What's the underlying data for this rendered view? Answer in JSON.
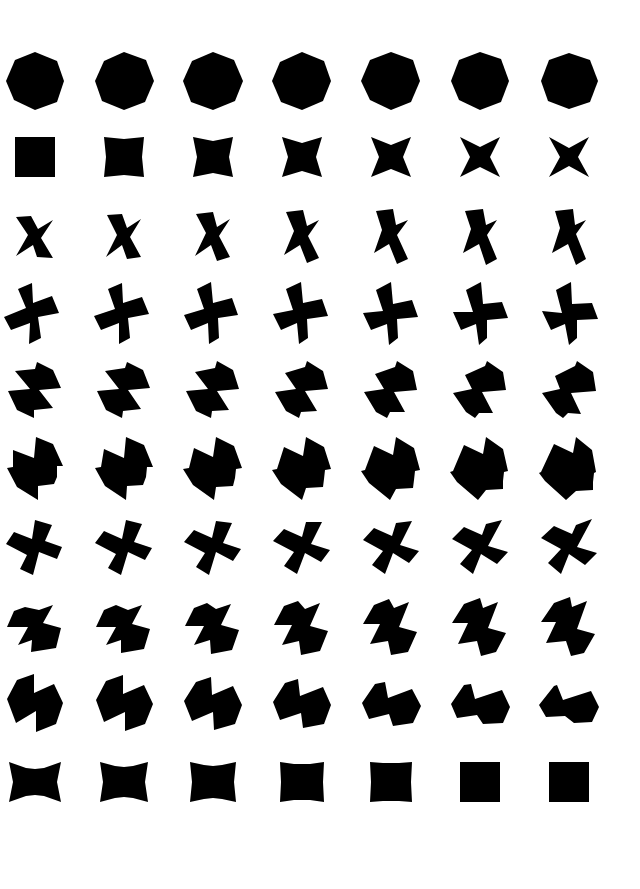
{
  "page": {
    "width": 640,
    "height": 889,
    "background": "#ffffff",
    "fill": "#000000"
  },
  "grid": {
    "columns": 7,
    "rows": 10,
    "col_centers": [
      35,
      124,
      213,
      302,
      391,
      480,
      569
    ],
    "row_centers": [
      81,
      157,
      237,
      313,
      390,
      468,
      547,
      627,
      703,
      782
    ]
  },
  "rows": [
    {
      "name": "octagon-row",
      "shapes": [
        "0,-29 22,-20 29,0 22,21 0,29 -21,19 -29,0 -20,-21",
        "0,-29 22,-21 30,0 21,21 0,29 -22,20 -29,0 -20,-20",
        "0,-29 21,-21 30,0 22,20 0,29 -22,21 -30,0 -21,-20",
        "0,-29 22,-20 29,0 21,20 0,29 -21,21 -30,0 -22,-19",
        "0,-29 22,-21 29,0 20,21 0,29 -21,19 -30,0 -21,-21",
        "0,-29 21,-22 29,0 21,21 0,29 -21,19 -29,0 -21,-21",
        "0,-28 21,-21 29,0 21,21 0,28 -21,20 -28,0 -20,-21"
      ]
    },
    {
      "name": "square-to-star-row",
      "shapes": [
        "-20,-20 0,-20 20,-20 20,0 20,20 0,20 -20,20 -20,0",
        "-20,-20 0,-18 20,-20 18,0 20,20 0,18 -20,20 -18,0",
        "-20,-20 0,-16 20,-20 16,0 20,20 0,16 -20,20 -16,0",
        "-20,-20 0,-14 20,-20 14,0 20,20 0,14 -20,20 -14,0",
        "-20,-20 0,-12 20,-20 12,0 20,20 0,12 -20,20 -12,0",
        "-20,-20 0,-10 20,-20 10,0 20,20 0,10 -20,20 -10,0",
        "-20,-20 0,-9 20,-20 9,0 20,20 0,9 -20,20 -9,0"
      ]
    },
    {
      "name": "twisted-bowtie-row",
      "shapes": [
        "-19,-20 -4,-21 3,-8 18,-17 6,1 18,21 2,20 -2,8 -19,19 -7,-2",
        "-17,-22 -2,-23 3,-9 17,-18 6,0 17,20 3,22 -2,8 -18,20 -7,-2",
        "-17,-23 0,-25 4,-10 17,-18 6,-1 17,20 4,24 -2,8 -18,19 -7,-4",
        "-16,-25 1,-27 5,-11 17,-17 6,-1 17,21 5,26 -2,8 -18,18 -8,-6",
        "-15,-26 2,-28 5,-12 17,-17 6,-2 17,22 6,27 -2,7 -17,16 -9,-7",
        "-15,-26 3,-28 6,-12 17,-17 7,-2 17,22 6,28 -1,7 -17,16 -9,-8",
        "-14,-26 4,-28 6,-12 17,-17 7,-3 17,22 7,28 -1,7 -17,16 -9,-9"
      ]
    },
    {
      "name": "pinwheel-row",
      "shapes": [
        "-17,-24 -3,-30 -2,-10 17,-17 24,0 3,4 6,25 -6,31 -5,10 -24,17 -31,4 -9,-5",
        "-16,-24 -2,-30 -1,-10 18,-16 25,1 4,5 6,25 -5,31 -5,10 -23,17 -30,3 -9,-4",
        "-16,-24 -2,-31 0,-10 19,-15 25,2 5,5 6,25 -4,31 -5,10 -22,17 -29,2 -9,-4",
        "-16,-24 -1,-31 1,-10 20,-14 26,3 5,6 6,25 -3,31 -5,10 -21,17 -29,1 -9,-3",
        "-15,-23 0,-31 2,-9 21,-13 27,4 6,6 7,25 -2,32 -4,11 -20,17 -28,0 -8,-2",
        "-14,-23 1,-31 3,-9 22,-11 28,5 7,7 7,25 -1,32 -4,11 -19,17 -27,-1 -7,-1",
        "-13,-23 2,-31 3,-9 23,-10 29,6 8,7 8,25 0,32 -4,11 -18,17 -27,-2 -7,0"
      ]
    },
    {
      "name": "zigzag-block-row",
      "shapes": [
        "-20,-19 0,-21 2,-28 18,-20 26,-2 4,0 18,18 -1,20 -1,28 -18,20 -27,1 -5,-1",
        "-19,-19 1,-22 3,-28 19,-20 26,-2 4,0 17,19 -1,21 -2,28 -18,20 -27,1 -5,-1",
        "-18,-18 2,-22 4,-29 20,-20 26,-1 4,1 16,20 -1,21 -2,28 -17,21 -27,1 -5,-1",
        "-17,-17 3,-23 5,-29 21,-19 26,-1 3,1 15,21 -1,22 -3,28 -16,21 -27,2 -6,-1",
        "-16,-16 4,-23 6,-29 22,-19 26,0 3,2 14,22 -1,22 -4,28 -15,22 -27,2 -7,-1",
        "-15,-15 5,-24 7,-29 23,-18 26,0 2,2 13,23 -1,23 -5,28 -14,22 -27,3 -8,-1",
        "-14,-14 6,-24 8,-29 24,-18 27,1 2,3 12,24 -1,23 -6,28 -13,23 -27,3 -9,-1"
      ]
    },
    {
      "name": "hook-block-row",
      "shapes": [
        "-22,-18 -1,-10 1,-31 18,-24 28,-2 22,-2 22,9 19,16 3,18 3,32 -18,19 -28,0 -22,-1",
        "-20,-19 0,-10 2,-31 20,-23 29,-1 23,-1 22,9 19,17 3,18 2,32 -19,18 -29,0 -23,-1",
        "-19,-20 0,-11 3,-31 21,-22 29,0 23,1 22,10 20,18 3,19 1,32 -20,17 -30,1 -24,0",
        "-18,-21 1,-12 4,-31 22,-21 29,1 23,2 22,11 21,19 4,20 0,32 -21,16 -30,2 -25,1",
        "-17,-22 2,-13 5,-31 23,-20 29,2 24,3 23,12 22,20 5,21 -1,32 -22,15 -30,3 -26,2",
        "-16,-23 3,-14 6,-31 23,-19 28,3 24,4 23,13 23,21 6,22 -2,32 -23,14 -30,4 -27,3",
        "-15,-24 4,-15 7,-31 23,-18 27,4 25,5 24,14 24,22 7,23 -3,32 -24,13 -30,5 -28,4"
      ]
    },
    {
      "name": "propeller-row",
      "shapes": [
        "-21,-15 -3,-8 0,-27 17,-22 10,-6 27,0 22,12 4,5 -2,28 -15,22 -8,8 -29,-3",
        "-20,-16 -2,-8 2,-27 18,-23 10,-5 28,1 21,13 4,5 -3,28 -16,21 -8,7 -29,-4",
        "-19,-17 -1,-9 3,-26 19,-24 10,-4 28,2 20,14 3,5 -4,28 -17,20 -8,6 -29,-5",
        "-18,-18 0,-10 4,-25 20,-25 9,-3 28,3 19,15 3,6 -5,27 -18,19 -8,5 -29,-6",
        "-17,-19 1,-11 5,-24 21,-26 9,-2 28,4 18,16 2,6 -6,27 -19,18 -8,4 -28,-7",
        "-16,-20 2,-12 6,-23 22,-27 8,-1 28,5 17,17 1,7 -7,27 -20,17 -8,3 -28,-8",
        "-15,-21 3,-13 7,-22 23,-28 8,0 28,6 16,18 0,7 -8,27 -21,16 -8,2 -28,-9"
      ]
    },
    {
      "name": "slanted-z-row",
      "shapes": [
        "-21,-16 -10,-20 4,-17 18,-22 8,-4 26,1 21,21 -4,25 -3,13 -17,18 -7,0 -28,0",
        "-20,-17 -8,-22 4,-17 18,-22 8,-3 26,2 20,22 -3,26 -3,13 -18,18 -8,0 -28,0",
        "-19,-19 -6,-24 3,-18 18,-23 8,-2 26,3 19,23 -2,27 -3,13 -19,18 -9,-1 -28,-1",
        "-18,-21 -4,-26 3,-18 18,-24 8,-1 26,4 18,24 -1,28 -3,14 -20,18 -10,-2 -28,-2",
        "-17,-22 -2,-28 3,-19 18,-25 8,0 26,5 17,25 0,28 -3,14 -21,17 -11,-3 -28,-3",
        "-16,-23 0,-29 3,-19 18,-25 8,1 26,6 16,25 1,29 -3,14 -22,17 -12,-4 -28,-4",
        "-15,-24 1,-30 3,-20 18,-26 8,2 26,7 15,26 2,29 -3,14 -23,16 -13,-5 -28,-5"
      ]
    },
    {
      "name": "double-hexagon-row",
      "shapes": [
        "-28,-4 -18,-23 -1,-29 -1,-10 19,-19 28,0 21,21 1,29 1,8 -19,20",
        "-28,-3 -18,-22 -1,-28 -1,-9 20,-18 29,1 21,21 1,28 1,9 -20,19",
        "-29,-2 -17,-21 -2,-26 -1,-8 20,-17 29,2 22,21 1,27 0,9 -21,18",
        "-29,-1 -17,-20 -4,-24 -2,-7 21,-16 29,2 22,21 1,25 -1,10 -22,17",
        "-29,0 -16,-19 -6,-21 -3,-5 21,-14 30,3 22,20 2,23 -2,11 -22,16",
        "-29,1 -16,-18 -9,-19 -5,-4 22,-13 30,4 23,20 3,21 -3,12 -23,15",
        "-30,2 -15,-17 -12,-18 -6,-3 22,-12 30,4 23,19 5,20 -4,13 -23,14"
      ]
    },
    {
      "name": "bowtie-to-square-row",
      "shapes": [
        "-26,-20 -9,-14 0,-13 9,-14 26,-20 22,0 26,20 9,14 0,13 -9,14 -26,20 -22,0",
        "-24,-20 -9,-16 0,-15 9,-16 24,-20 21,0 24,20 9,16 0,15 -9,16 -24,20 -21,0",
        "-23,-20 -9,-17 0,-16 9,-17 23,-20 21,0 23,20 9,17 0,16 -9,17 -23,20 -21,0",
        "-22,-20 -8,-18 0,-18 8,-18 22,-20 21,0 22,20 8,18 0,18 -8,18 -22,20 -21,0",
        "-21,-20 -8,-19 0,-19 8,-19 21,-20 20,0 21,20 8,19 0,19 -8,19 -21,20 -20,0",
        "-20,-20 -8,-20 0,-20 8,-20 20,-20 20,0 20,20 8,20 0,20 -8,20 -20,20 -20,0",
        "-20,-20 0,-20 20,-20 20,0 20,20 0,20 -20,20 -20,0"
      ]
    }
  ]
}
